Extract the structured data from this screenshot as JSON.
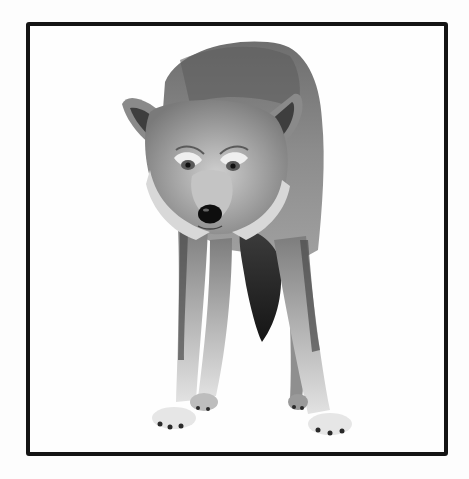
{
  "image": {
    "subject": "wolf standing, facing camera",
    "style": "black-and-white photograph in black border frame",
    "alt": "Black-and-white photo of a wolf standing and staring at the camera, framed by a thick black border"
  },
  "colors": {
    "background": "#fdfdfd",
    "frame": "#141414",
    "fur_dark": "#3a3a3a",
    "fur_mid": "#8a8a8a",
    "fur_light": "#d6d6d6",
    "nose": "#0e0e0e"
  }
}
